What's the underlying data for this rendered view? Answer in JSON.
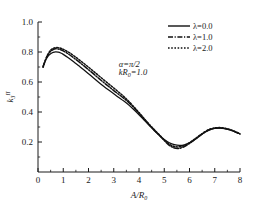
{
  "chart_data": {
    "type": "line",
    "title": "",
    "xlabel": "A/R0",
    "xlabel_parts": {
      "num": "A",
      "slash": "/",
      "den": "R",
      "den_sub": "0"
    },
    "ylabel": "k3",
    "ylabel_parts": {
      "base": "k",
      "sub": "3",
      "sup": "II"
    },
    "xlim": [
      0,
      8
    ],
    "ylim": [
      0,
      1.0
    ],
    "xticks": [
      "0",
      "1",
      "2",
      "3",
      "4",
      "5",
      "6",
      "7",
      "8"
    ],
    "xtick_values": [
      0,
      1,
      2,
      3,
      4,
      5,
      6,
      7,
      8
    ],
    "yticks": [
      "0.2",
      "0.4",
      "0.6",
      "0.8",
      "1.0"
    ],
    "ytick_values": [
      0.2,
      0.4,
      0.6,
      0.8,
      1.0
    ],
    "minor_ticks": true,
    "grid": false,
    "legend_position": "top-right",
    "annotations": [
      {
        "text": "alpha=pi/2",
        "x": 3.2,
        "y": 0.7
      },
      {
        "text": "kR0=1.0",
        "x": 3.2,
        "y": 0.645
      }
    ],
    "series": [
      {
        "name": "lambda=0.0",
        "label": "λ=0.0",
        "style": "solid",
        "color": "#111111",
        "x": [
          0.2,
          0.3,
          0.4,
          0.5,
          0.6,
          0.7,
          0.8,
          0.9,
          1.0,
          1.2,
          1.4,
          1.6,
          1.8,
          2.0,
          2.2,
          2.4,
          2.6,
          2.8,
          3.0,
          3.2,
          3.4,
          3.6,
          3.8,
          4.0,
          4.2,
          4.4,
          4.6,
          4.8,
          5.0,
          5.2,
          5.4,
          5.6,
          5.8,
          6.0,
          6.2,
          6.4,
          6.6,
          6.8,
          7.0,
          7.2,
          7.4,
          7.6,
          7.8,
          8.0
        ],
        "y": [
          0.705,
          0.745,
          0.772,
          0.789,
          0.798,
          0.801,
          0.799,
          0.793,
          0.784,
          0.762,
          0.737,
          0.71,
          0.683,
          0.655,
          0.627,
          0.599,
          0.572,
          0.546,
          0.521,
          0.497,
          0.473,
          0.446,
          0.415,
          0.382,
          0.347,
          0.312,
          0.277,
          0.245,
          0.216,
          0.195,
          0.182,
          0.177,
          0.181,
          0.194,
          0.215,
          0.24,
          0.263,
          0.281,
          0.291,
          0.293,
          0.289,
          0.28,
          0.268,
          0.253
        ]
      },
      {
        "name": "lambda=1.0",
        "label": "λ=1.0",
        "style": "dashdot",
        "color": "#111111",
        "x": [
          0.2,
          0.3,
          0.4,
          0.5,
          0.6,
          0.7,
          0.8,
          0.9,
          1.0,
          1.2,
          1.4,
          1.6,
          1.8,
          2.0,
          2.2,
          2.4,
          2.6,
          2.8,
          3.0,
          3.2,
          3.4,
          3.6,
          3.8,
          4.0,
          4.2,
          4.4,
          4.6,
          4.8,
          5.0,
          5.2,
          5.4,
          5.6,
          5.8,
          6.0,
          6.2,
          6.4,
          6.6,
          6.8,
          7.0,
          7.2,
          7.4,
          7.6,
          7.8,
          8.0
        ],
        "y": [
          0.7,
          0.748,
          0.782,
          0.804,
          0.816,
          0.821,
          0.82,
          0.815,
          0.807,
          0.787,
          0.763,
          0.737,
          0.71,
          0.682,
          0.654,
          0.625,
          0.597,
          0.57,
          0.543,
          0.517,
          0.491,
          0.462,
          0.428,
          0.392,
          0.354,
          0.316,
          0.28,
          0.246,
          0.21,
          0.178,
          0.16,
          0.158,
          0.17,
          0.19,
          0.215,
          0.241,
          0.265,
          0.283,
          0.292,
          0.294,
          0.29,
          0.281,
          0.269,
          0.254
        ]
      },
      {
        "name": "lambda=2.0",
        "label": "λ=2.0",
        "style": "dotted",
        "color": "#111111",
        "x": [
          0.2,
          0.3,
          0.4,
          0.5,
          0.6,
          0.7,
          0.8,
          0.9,
          1.0,
          1.2,
          1.4,
          1.6,
          1.8,
          2.0,
          2.2,
          2.4,
          2.6,
          2.8,
          3.0,
          3.2,
          3.4,
          3.6,
          3.8,
          4.0,
          4.2,
          4.4,
          4.6,
          4.8,
          5.0,
          5.2,
          5.4,
          5.6,
          5.8,
          6.0,
          6.2,
          6.4,
          6.6,
          6.8,
          7.0,
          7.2,
          7.4,
          7.6,
          7.8,
          8.0
        ],
        "y": [
          0.698,
          0.75,
          0.788,
          0.812,
          0.824,
          0.829,
          0.829,
          0.825,
          0.818,
          0.8,
          0.777,
          0.752,
          0.726,
          0.699,
          0.671,
          0.643,
          0.615,
          0.587,
          0.56,
          0.532,
          0.503,
          0.47,
          0.434,
          0.396,
          0.357,
          0.319,
          0.283,
          0.249,
          0.214,
          0.186,
          0.17,
          0.168,
          0.178,
          0.196,
          0.219,
          0.244,
          0.267,
          0.285,
          0.294,
          0.296,
          0.292,
          0.283,
          0.27,
          0.255
        ]
      }
    ]
  },
  "legend": {
    "entries": [
      {
        "label": "λ=0.0",
        "style": "solid"
      },
      {
        "label": "λ=1.0",
        "style": "dashdot"
      },
      {
        "label": "λ=2.0",
        "style": "dotted"
      }
    ]
  },
  "annotations": {
    "alpha_symbol": "α",
    "alpha_value": "=π/2",
    "k_symbol": "kR",
    "k_sub": "0",
    "k_value": "=1.0"
  },
  "axes": {
    "x_title_num": "A",
    "x_title_slash": "/",
    "x_title_den": "R",
    "x_title_sub": "0",
    "y_title_base": "k",
    "y_title_sub": "3",
    "y_title_sup": "II"
  }
}
